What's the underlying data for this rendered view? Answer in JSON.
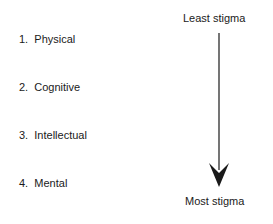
{
  "items": [
    {
      "num": "1.",
      "label": "Physical"
    },
    {
      "num": "2.",
      "label": "Cognitive"
    },
    {
      "num": "3.",
      "label": "Intellectual"
    },
    {
      "num": "4.",
      "label": "Mental"
    }
  ],
  "scale": {
    "top_label": "Least stigma",
    "bottom_label": "Most stigma"
  }
}
